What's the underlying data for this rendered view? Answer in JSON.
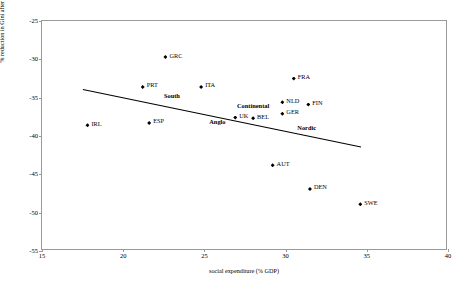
{
  "chart_data": {
    "type": "scatter",
    "title": "",
    "xlabel": "social expenditure (% GDP)",
    "ylabel": "% reduction in Gini after taxes and transfers",
    "xlim": [
      15,
      40
    ],
    "ylim": [
      -25,
      -55
    ],
    "xticks": [
      "15",
      "20",
      "25",
      "30",
      "35",
      "40"
    ],
    "yticks": [
      "-55",
      "-50",
      "-45",
      "-40",
      "-35",
      "-30",
      "-25"
    ],
    "grid": false,
    "legend": "none",
    "points": [
      {
        "label": "IRL",
        "x": 17.8,
        "y": -38.6
      },
      {
        "label": "ESP",
        "x": 21.6,
        "y": -38.3
      },
      {
        "label": "PRT",
        "x": 21.2,
        "y": -33.6
      },
      {
        "label": "GRC",
        "x": 22.6,
        "y": -29.7
      },
      {
        "label": "ITA",
        "x": 24.8,
        "y": -33.6
      },
      {
        "label": "UK",
        "x": 26.9,
        "y": -37.6
      },
      {
        "label": "BEL",
        "x": 28.0,
        "y": -37.7
      },
      {
        "label": "AUT",
        "x": 29.2,
        "y": -43.8
      },
      {
        "label": "GER",
        "x": 29.8,
        "y": -37.1
      },
      {
        "label": "NLD",
        "x": 29.8,
        "y": -35.6
      },
      {
        "label": "FIN",
        "x": 31.4,
        "y": -35.9
      },
      {
        "label": "FRA",
        "x": 30.5,
        "y": -32.5
      },
      {
        "label": "DEN",
        "x": 31.5,
        "y": -46.9
      },
      {
        "label": "SWE",
        "x": 34.6,
        "y": -48.9
      },
      {
        "label": "Continental",
        "x": 28.0,
        "y": -36.1,
        "group": true
      },
      {
        "label": "South",
        "x": 23.0,
        "y": -34.8,
        "group": true
      },
      {
        "label": "Anglo",
        "x": 25.8,
        "y": -38.2,
        "group": true
      },
      {
        "label": "Nordic",
        "x": 31.3,
        "y": -38.9,
        "group": true
      }
    ],
    "group_labels": [
      "Anglo",
      "South",
      "Continental",
      "Nordic"
    ],
    "trendline": {
      "x0": 17.5,
      "y0": -33.9,
      "x1": 34.6,
      "y1": -41.4
    }
  }
}
